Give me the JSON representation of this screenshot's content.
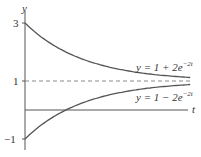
{
  "chart_data": {
    "type": "line",
    "title": "",
    "xlabel": "t",
    "ylabel": "y",
    "y_ticks": [
      "3",
      "1",
      "-1"
    ],
    "ylim": [
      -1,
      3
    ],
    "xlim": [
      0,
      1.4
    ],
    "series": [
      {
        "name": "y = 1 + 2e^{-2t}",
        "label_text": "y = 1 + 2e",
        "exp_text": "−2t",
        "x": [
          0,
          0.2,
          0.4,
          0.6,
          0.8,
          1.0,
          1.2,
          1.4
        ],
        "values": [
          3.0,
          2.34,
          1.9,
          1.6,
          1.4,
          1.27,
          1.18,
          1.12
        ]
      },
      {
        "name": "y = 1 − 2e^{-2t}",
        "label_text": "y = 1 − 2e",
        "exp_text": "−2t",
        "x": [
          0,
          0.2,
          0.4,
          0.6,
          0.8,
          1.0,
          1.2,
          1.4
        ],
        "values": [
          -1.0,
          -0.34,
          0.1,
          0.4,
          0.6,
          0.73,
          0.82,
          0.88
        ]
      },
      {
        "name": "asymptote y = 1",
        "style": "dashed",
        "x": [
          0,
          1.4
        ],
        "values": [
          1,
          1
        ]
      }
    ],
    "grid": false,
    "legend": "inline labels"
  },
  "axes": {
    "y_label": "y",
    "t_label": "t",
    "tick_3": "3",
    "tick_1": "1",
    "tick_neg1": "−1"
  },
  "labels": {
    "upper_main": "y = 1 + 2e",
    "upper_exp": "−2t",
    "lower_main": "y = 1 − 2e",
    "lower_exp": "−2t"
  },
  "colors": {
    "curve": "#555555",
    "axis": "#555555",
    "dashed": "#888888"
  }
}
